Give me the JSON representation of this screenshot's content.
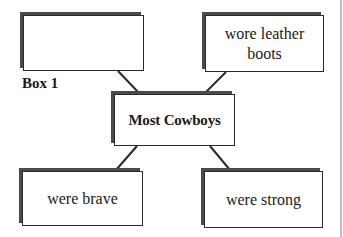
{
  "diagram": {
    "type": "concept-map",
    "center": {
      "text": "Most Cowboys"
    },
    "boxes": [
      {
        "position": "top-left",
        "text": "",
        "label": "Box 1"
      },
      {
        "position": "top-right",
        "text": "wore leather boots"
      },
      {
        "position": "bottom-left",
        "text": "were brave"
      },
      {
        "position": "bottom-right",
        "text": "were strong"
      }
    ],
    "colors": {
      "border": "#2a2a2a",
      "shadow": "#4a4a4a",
      "text": "#1a1a1a",
      "background": "#ffffff"
    }
  }
}
